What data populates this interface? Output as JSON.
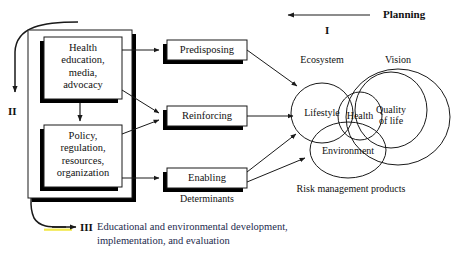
{
  "diagram": {
    "title_hidden": "PRECEDE-PROCEED style planning model",
    "phases": {
      "phase_one_label": "I",
      "phase_one_text": "Planning",
      "phase_two_label": "II",
      "phase_three_label": "III",
      "phase_three_text": "Educational and environmental development,\nimplementation, and evaluation"
    },
    "input_boxes": [
      {
        "id": "health-education",
        "text": "Health\neducation,\nmedia,\nadvocacy"
      },
      {
        "id": "policy-regulation",
        "text": "Policy,\nregulation,\nresources,\norganization"
      }
    ],
    "factor_boxes": [
      {
        "id": "predisposing",
        "text": "Predisposing"
      },
      {
        "id": "reinforcing",
        "text": "Reinforcing"
      },
      {
        "id": "enabling",
        "text": "Enabling"
      }
    ],
    "captions": {
      "determinants": "Determinants",
      "ecosystem": "Ecosystem",
      "vision": "Vision",
      "risk_management": "Risk management products"
    },
    "circles": [
      {
        "id": "lifestyle",
        "text": "Lifestyle"
      },
      {
        "id": "health",
        "text": "Health"
      },
      {
        "id": "quality-of-life",
        "text": "Quality\nof life"
      },
      {
        "id": "environment",
        "text": "Environment"
      }
    ],
    "colors": {
      "line": "#1a1a1a",
      "shadow": "#000000",
      "box_fill": "#ffffff",
      "bottom_text": "#232a4d",
      "highlight": "#f2e84a",
      "background": "#ffffff"
    }
  }
}
